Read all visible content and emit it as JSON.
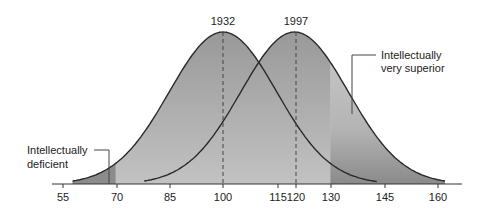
{
  "chart_data": {
    "type": "area",
    "title": "",
    "xlabel": "",
    "ylabel": "",
    "x_ticks": [
      55,
      70,
      85,
      100,
      115,
      120,
      130,
      145,
      160
    ],
    "xlim": [
      52,
      163
    ],
    "grid": false,
    "series": [
      {
        "name": "1932",
        "mean": 100,
        "sd": 15,
        "marker_label": "1932"
      },
      {
        "name": "1997",
        "mean": 120,
        "sd": 15,
        "marker_label": "1997"
      }
    ],
    "annotations": [
      {
        "text": "Intellectually deficient",
        "lines": [
          "Intellectually",
          "deficient"
        ],
        "region": "below 70"
      },
      {
        "text": "Intellectually very superior",
        "lines": [
          "Intellectually",
          "very superior"
        ],
        "region": "above 130"
      }
    ]
  },
  "labels": {
    "year1": "1932",
    "year2": "1997",
    "deficient_line1": "Intellectually",
    "deficient_line2": "deficient",
    "superior_line1": "Intellectually",
    "superior_line2": "very superior"
  },
  "ticks": [
    "55",
    "70",
    "85",
    "100",
    "115",
    "120",
    "130",
    "145",
    "160"
  ],
  "colors": {
    "dark_fill": "#8e8e8e",
    "mid_fill": "#a9a9a9",
    "light_fill": "#c9c9c9",
    "curve": "#2a2a2a",
    "axis": "#333333"
  }
}
